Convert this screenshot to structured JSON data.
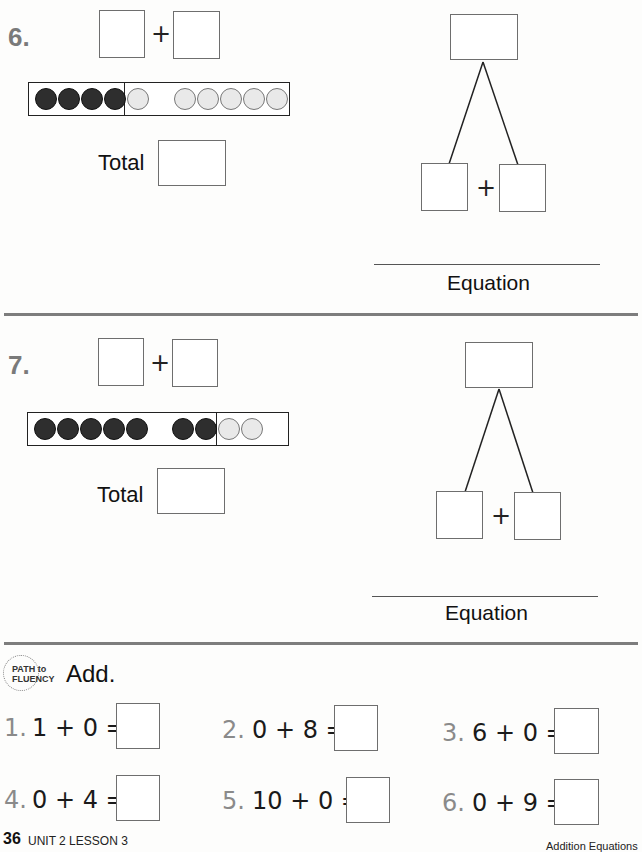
{
  "problems": [
    {
      "number": "6.",
      "plus": "+",
      "total_label": "Total",
      "equation_label": "Equation",
      "ten_frame": {
        "left_group": [
          "filled",
          "filled",
          "filled",
          "filled"
        ],
        "right_group": [
          "empty",
          "gap",
          "empty",
          "empty",
          "empty",
          "empty",
          "empty"
        ],
        "filled_count": 4,
        "empty_count": 6
      },
      "bond_plus": "+"
    },
    {
      "number": "7.",
      "plus": "+",
      "total_label": "Total",
      "equation_label": "Equation",
      "ten_frame": {
        "left_group": [
          "filled",
          "filled",
          "filled",
          "filled",
          "filled",
          "gap",
          "filled",
          "filled"
        ],
        "right_group": [
          "empty",
          "empty"
        ],
        "filled_count": 7,
        "empty_count": 2
      },
      "bond_plus": "+"
    }
  ],
  "fluency": {
    "badge_line1": "PATH to",
    "badge_line2": "FLUENCY",
    "instruction": "Add.",
    "items": [
      {
        "num": "1.",
        "expr": "1 + 0 ="
      },
      {
        "num": "2.",
        "expr": "0 + 8 ="
      },
      {
        "num": "3.",
        "expr": "6 + 0 ="
      },
      {
        "num": "4.",
        "expr": "0 + 4 ="
      },
      {
        "num": "5.",
        "expr": "10 + 0 ="
      },
      {
        "num": "6.",
        "expr": "0 + 9 ="
      }
    ]
  },
  "footer": {
    "page_number": "36",
    "lesson": "UNIT 2 LESSON 3",
    "right_text": "Addition Equations"
  },
  "colors": {
    "filled_dot": "#2e2e2e",
    "empty_dot": "#e9e9e9",
    "question_number": "#7a7a7a",
    "separator": "#7d7d7d"
  }
}
